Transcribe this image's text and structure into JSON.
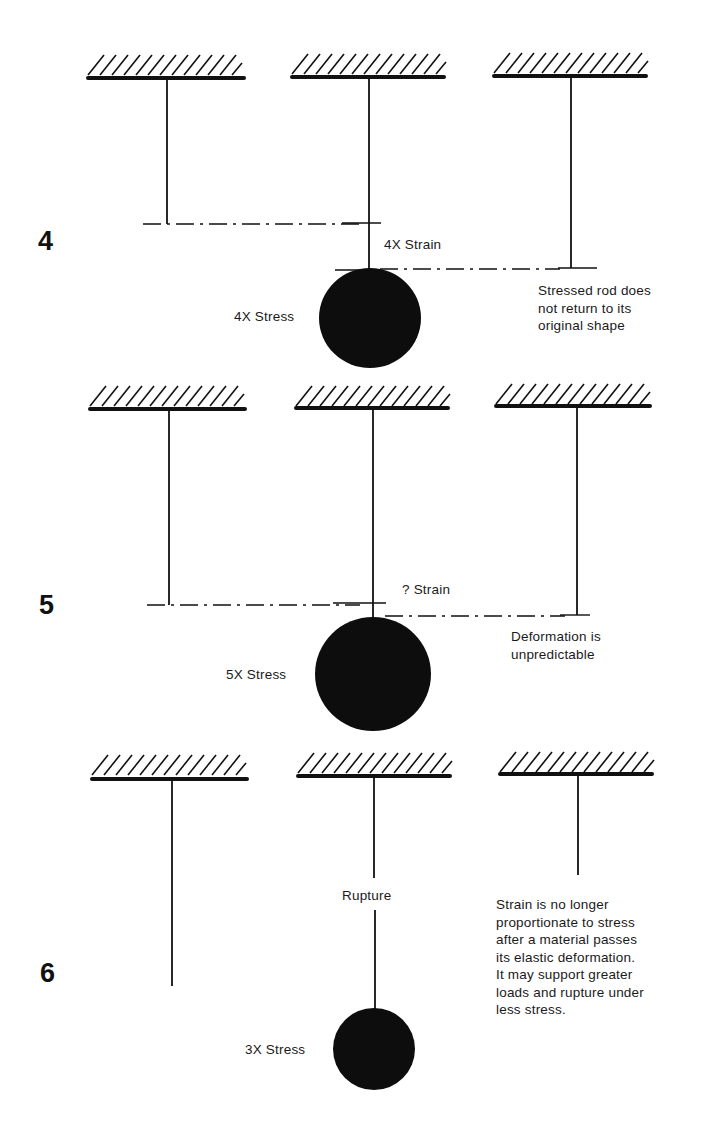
{
  "diagram": {
    "title": "",
    "panels": [
      {
        "step": "4",
        "strain_label": "4X Strain",
        "stress_label": "4X Stress",
        "note_lines": [
          "Stressed rod does",
          "not return to its",
          "original shape"
        ]
      },
      {
        "step": "5",
        "strain_label": "? Strain",
        "stress_label": "5X Stress",
        "note_lines": [
          "Deformation is",
          "unpredictable"
        ]
      },
      {
        "step": "6",
        "rupture_label": "Rupture",
        "stress_label": "3X Stress",
        "note_lines": [
          "Strain is no longer",
          "proportionate to stress",
          "after a material passes",
          "its elastic deformation.",
          "It may support greater",
          "loads and rupture under",
          "less stress."
        ]
      }
    ],
    "colors": {
      "ink": "#111111",
      "background": "#ffffff"
    }
  }
}
